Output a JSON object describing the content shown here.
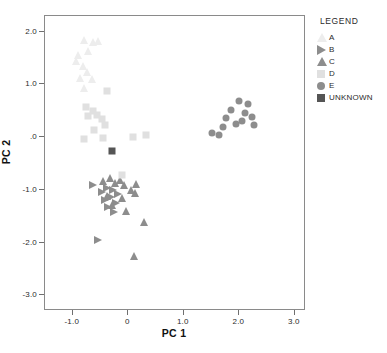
{
  "chart_data": {
    "type": "scatter",
    "title": "",
    "xlabel": "PC 1",
    "ylabel": "PC 2",
    "xlim": [
      -1.5,
      3.2
    ],
    "ylim": [
      -3.3,
      2.3
    ],
    "xticks": [
      "-1.0",
      "0",
      "1.0",
      "2.0",
      "3.0"
    ],
    "xtick_values": [
      -1.0,
      0,
      1.0,
      2.0,
      3.0
    ],
    "yticks": [
      "2.0",
      "1.0",
      ".0",
      "-1.0",
      "-2.0",
      "-3.0"
    ],
    "ytick_values": [
      2.0,
      1.0,
      0.0,
      -1.0,
      -2.0,
      -3.0
    ],
    "grid": false,
    "legend_position": "right-outside",
    "legend_title": "LEGEND",
    "series": [
      {
        "name": "A",
        "marker": "triangle-up",
        "color": "#ededed",
        "points": [
          [
            -0.78,
            1.82
          ],
          [
            -0.7,
            1.62
          ],
          [
            -0.88,
            1.55
          ],
          [
            -0.62,
            1.78
          ],
          [
            -0.52,
            1.8
          ],
          [
            -0.8,
            1.34
          ],
          [
            -0.72,
            1.22
          ],
          [
            -0.86,
            1.1
          ],
          [
            -0.64,
            1.08
          ],
          [
            -0.78,
            0.92
          ],
          [
            -0.92,
            1.42
          ]
        ]
      },
      {
        "name": "B",
        "marker": "triangle-right",
        "color": "#8d8d8d",
        "points": [
          [
            -0.62,
            -0.92
          ],
          [
            -0.46,
            -1.06
          ],
          [
            -0.36,
            -0.98
          ],
          [
            -0.3,
            -1.16
          ],
          [
            -0.26,
            -1.02
          ],
          [
            -0.4,
            -1.22
          ],
          [
            -0.2,
            -1.26
          ],
          [
            -0.16,
            -1.1
          ],
          [
            -0.34,
            -1.34
          ],
          [
            -0.24,
            -1.44
          ],
          [
            -0.52,
            -1.98
          ]
        ]
      },
      {
        "name": "C",
        "marker": "triangle-up",
        "color": "#8d8d8d",
        "points": [
          [
            -0.44,
            -0.86
          ],
          [
            -0.32,
            -0.8
          ],
          [
            -0.22,
            -0.88
          ],
          [
            -0.14,
            -0.84
          ],
          [
            -0.06,
            -0.92
          ],
          [
            -0.36,
            -1.14
          ],
          [
            -0.1,
            -1.18
          ],
          [
            0.06,
            -1.02
          ],
          [
            0.14,
            -1.08
          ],
          [
            0.16,
            -0.9
          ],
          [
            -0.02,
            -1.42
          ],
          [
            0.3,
            -1.62
          ],
          [
            0.12,
            -2.28
          ],
          [
            -0.28,
            -1.3
          ]
        ]
      },
      {
        "name": "D",
        "marker": "square",
        "color": "#e0e0e0",
        "points": [
          [
            -0.74,
            0.56
          ],
          [
            -0.62,
            0.48
          ],
          [
            -0.7,
            0.38
          ],
          [
            -0.54,
            0.4
          ],
          [
            -0.46,
            0.32
          ],
          [
            -0.4,
            0.22
          ],
          [
            -0.6,
            0.12
          ],
          [
            -0.78,
            -0.06
          ],
          [
            -0.36,
            0.86
          ],
          [
            -0.44,
            -0.04
          ],
          [
            0.1,
            -0.02
          ],
          [
            0.34,
            0.02
          ],
          [
            -0.1,
            -0.74
          ]
        ]
      },
      {
        "name": "E",
        "marker": "circle",
        "color": "#8d8d8d",
        "points": [
          [
            1.52,
            0.06
          ],
          [
            1.78,
            0.34
          ],
          [
            1.72,
            0.18
          ],
          [
            1.86,
            0.5
          ],
          [
            1.96,
            0.24
          ],
          [
            2.06,
            0.28
          ],
          [
            2.12,
            0.44
          ],
          [
            2.18,
            0.62
          ],
          [
            2.24,
            0.36
          ],
          [
            2.02,
            0.66
          ],
          [
            1.66,
            0.02
          ],
          [
            2.28,
            0.22
          ]
        ]
      },
      {
        "name": "UNKNOWN",
        "marker": "square",
        "color": "#555555",
        "points": [
          [
            -0.28,
            -0.28
          ]
        ]
      }
    ]
  },
  "legend": {
    "title": "LEGEND",
    "items": [
      {
        "label": "A",
        "marker": "triangle-up",
        "color": "#ededed"
      },
      {
        "label": "B",
        "marker": "triangle-right",
        "color": "#8d8d8d"
      },
      {
        "label": "C",
        "marker": "triangle-up",
        "color": "#8d8d8d"
      },
      {
        "label": "D",
        "marker": "square",
        "color": "#e0e0e0"
      },
      {
        "label": "E",
        "marker": "circle",
        "color": "#8d8d8d"
      },
      {
        "label": "UNKNOWN",
        "marker": "square",
        "color": "#555555"
      }
    ]
  },
  "axes": {
    "x_title": "PC 1",
    "y_title": "PC 2"
  }
}
